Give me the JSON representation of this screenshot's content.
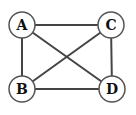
{
  "graph": {
    "nodes": [
      {
        "id": "A",
        "label": "A",
        "x": 22,
        "y": 25
      },
      {
        "id": "C",
        "label": "C",
        "x": 111,
        "y": 25
      },
      {
        "id": "B",
        "label": "B",
        "x": 22,
        "y": 89
      },
      {
        "id": "D",
        "label": "D",
        "x": 112,
        "y": 89
      }
    ],
    "edges": [
      {
        "from": "A",
        "to": "C"
      },
      {
        "from": "A",
        "to": "B"
      },
      {
        "from": "A",
        "to": "D"
      },
      {
        "from": "C",
        "to": "B"
      },
      {
        "from": "C",
        "to": "D"
      },
      {
        "from": "B",
        "to": "D"
      }
    ],
    "node_radius": 13,
    "colors": {
      "edge": "#444444",
      "node_border": "#555555",
      "node_fill": "#ffffff",
      "label": "#111111"
    }
  }
}
